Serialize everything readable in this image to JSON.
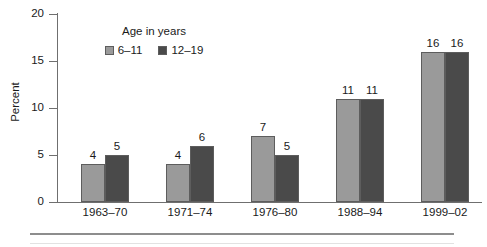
{
  "chart_data": {
    "type": "bar",
    "title": "",
    "xlabel": "",
    "ylabel": "Percent",
    "ylim": [
      0,
      20
    ],
    "yticks": [
      0,
      5,
      10,
      15,
      20
    ],
    "grid": false,
    "legend_position": "top-left-inside",
    "legend_title": "Age in years",
    "categories": [
      "1963–70",
      "1971–74",
      "1976–80",
      "1988–94",
      "1999–02"
    ],
    "series": [
      {
        "name": "6–11",
        "color": "#9a9a9a",
        "values": [
          4,
          4,
          7,
          11,
          16
        ]
      },
      {
        "name": "12–19",
        "color": "#4a4a4a",
        "values": [
          5,
          6,
          5,
          11,
          16
        ]
      }
    ],
    "data_labels": [
      [
        "4",
        "5"
      ],
      [
        "4",
        "6"
      ],
      [
        "7",
        "5"
      ],
      [
        "11",
        "11"
      ],
      [
        "16",
        "16"
      ]
    ]
  },
  "axis": {
    "y_tick_labels": [
      "0",
      "5",
      "10",
      "15",
      "20"
    ],
    "y_axis_title": "Percent"
  },
  "legend": {
    "title": "Age in years",
    "entries": [
      {
        "label": "6–11",
        "color": "#9a9a9a"
      },
      {
        "label": "12–19",
        "color": "#4a4a4a"
      }
    ]
  }
}
